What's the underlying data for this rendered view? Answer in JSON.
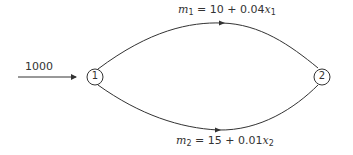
{
  "diagram": {
    "type": "network-flow",
    "input_flow": {
      "label": "1000",
      "to": "1"
    },
    "nodes": [
      {
        "id": "1",
        "label": "1"
      },
      {
        "id": "2",
        "label": "2"
      }
    ],
    "edges": [
      {
        "from": "1",
        "to": "2",
        "position": "upper",
        "cost": {
          "var": "m",
          "sub": "1",
          "eq": " = 10 + 0.04",
          "x": "x",
          "xsub": "1"
        }
      },
      {
        "from": "1",
        "to": "2",
        "position": "lower",
        "cost": {
          "var": "m",
          "sub": "2",
          "eq": " = 15 + 0.01",
          "x": "x",
          "xsub": "2"
        }
      }
    ],
    "colors": {
      "line": "#333333",
      "text": "#333333",
      "background": "#ffffff"
    }
  }
}
